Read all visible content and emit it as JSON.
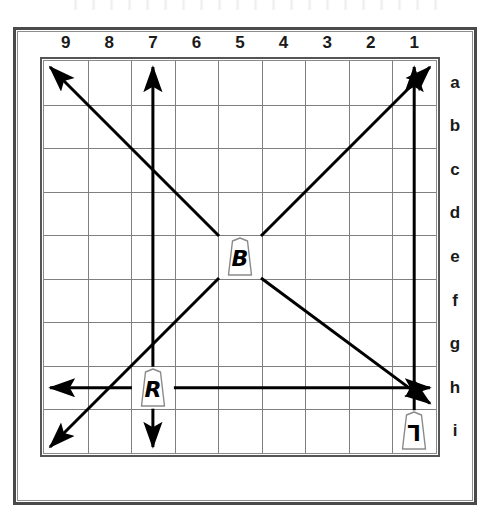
{
  "board": {
    "title": "Shogi board movement diagram",
    "columns": [
      "9",
      "8",
      "7",
      "6",
      "5",
      "4",
      "3",
      "2",
      "1"
    ],
    "rows": [
      "a",
      "b",
      "c",
      "d",
      "e",
      "f",
      "g",
      "h",
      "i"
    ],
    "grid_size": 9,
    "line_color": "#7f7f7f",
    "frame_color": "#4a4a4a",
    "arrow_color": "#000000",
    "background": "#ffffff"
  },
  "pieces": [
    {
      "id": "bishop",
      "label": "B",
      "name": "Bishop",
      "file": "5",
      "rank": "e",
      "col_index": 4,
      "row_index": 4,
      "rotated": false
    },
    {
      "id": "rook",
      "label": "R",
      "name": "Rook",
      "file": "7",
      "rank": "h",
      "col_index": 2,
      "row_index": 7,
      "rotated": false
    },
    {
      "id": "lance",
      "label": "L",
      "name": "Lance",
      "file": "1",
      "rank": "i",
      "col_index": 8,
      "row_index": 8,
      "rotated": true
    }
  ],
  "arrows": [
    {
      "id": "bishop-up-left",
      "piece": "bishop",
      "direction": "up-left",
      "from": "5e",
      "to": "9a",
      "double_head": false
    },
    {
      "id": "bishop-up-right",
      "piece": "bishop",
      "direction": "up-right",
      "from": "5e",
      "to": "1a",
      "double_head": false
    },
    {
      "id": "bishop-down-left",
      "piece": "bishop",
      "direction": "down-left",
      "from": "5e",
      "to": "9i",
      "double_head": false
    },
    {
      "id": "bishop-down-right",
      "piece": "bishop",
      "direction": "down-right",
      "from": "5e",
      "to": "1h",
      "double_head": false
    },
    {
      "id": "rook-up",
      "piece": "rook",
      "direction": "up",
      "from": "7h",
      "to": "7a",
      "double_head": false
    },
    {
      "id": "rook-down",
      "piece": "rook",
      "direction": "down",
      "from": "7h",
      "to": "7i",
      "double_head": false
    },
    {
      "id": "rook-left",
      "piece": "rook",
      "direction": "left",
      "from": "7h",
      "to": "9h",
      "double_head": false
    },
    {
      "id": "rook-right",
      "piece": "rook",
      "direction": "right",
      "from": "7h",
      "to": "1h",
      "double_head": false
    },
    {
      "id": "lance-up",
      "piece": "lance",
      "direction": "up",
      "from": "1i",
      "to": "1a",
      "double_head": false
    }
  ],
  "caption": ""
}
